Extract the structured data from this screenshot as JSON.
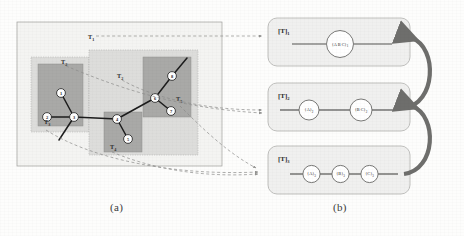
{
  "figure": {
    "captions": {
      "left": "(a)",
      "right": "(b)"
    }
  },
  "panel_a": {
    "name": "graph-partition-diagram",
    "region_labels": [
      {
        "id": "t1",
        "text": "T",
        "sub": "1",
        "x": 88,
        "y": 36
      },
      {
        "id": "t2-left",
        "text": "T",
        "sub": "2",
        "x": 64,
        "y": 62
      },
      {
        "id": "t2-right",
        "text": "T",
        "sub": "2",
        "x": 120,
        "y": 76
      },
      {
        "id": "t3",
        "text": "T",
        "sub": "3",
        "x": 42,
        "y": 128
      },
      {
        "id": "t4",
        "text": "T",
        "sub": "4",
        "x": 113,
        "y": 147
      },
      {
        "id": "t5",
        "text": "T",
        "sub": "5",
        "x": 180,
        "y": 102
      }
    ],
    "nodes": [
      {
        "id": "n1",
        "label": "1",
        "cx": 61,
        "cy": 93
      },
      {
        "id": "n2",
        "label": "2",
        "cx": 47,
        "cy": 117
      },
      {
        "id": "n3",
        "label": "3",
        "cx": 74,
        "cy": 117
      },
      {
        "id": "n4",
        "label": "4",
        "cx": 117,
        "cy": 119
      },
      {
        "id": "n5",
        "label": "5",
        "cx": 128,
        "cy": 139
      },
      {
        "id": "n6",
        "label": "6",
        "cx": 155,
        "cy": 98
      },
      {
        "id": "n7",
        "label": "7",
        "cx": 171,
        "cy": 111
      },
      {
        "id": "n8",
        "label": "8",
        "cx": 172,
        "cy": 76
      }
    ],
    "edges": [
      {
        "from": "n1",
        "to": "n3"
      },
      {
        "from": "n2",
        "to": "n3"
      },
      {
        "from": "n3",
        "to": "n4"
      },
      {
        "from": "n3",
        "to": "stub-a"
      },
      {
        "from": "n4",
        "to": "n5"
      },
      {
        "from": "n4",
        "to": "n6"
      },
      {
        "from": "n6",
        "to": "n7"
      },
      {
        "from": "n6",
        "to": "n8"
      },
      {
        "from": "n8",
        "to": "stub-b"
      }
    ]
  },
  "panel_b": {
    "name": "hierarchy-levels",
    "levels": [
      {
        "id": "level-1",
        "label": "[T]",
        "sub": "1",
        "nodes": [
          {
            "text": "{A B C}",
            "sub": "1"
          }
        ]
      },
      {
        "id": "level-2",
        "label": "[T]",
        "sub": "2",
        "nodes": [
          {
            "text": "{A}",
            "sub": "2"
          },
          {
            "text": "{B C}",
            "sub": "2"
          }
        ]
      },
      {
        "id": "level-3",
        "label": "[T]",
        "sub": "3",
        "nodes": [
          {
            "text": "{A}",
            "sub": "3"
          },
          {
            "text": "{B}",
            "sub": "3"
          },
          {
            "text": "{C}",
            "sub": "3"
          }
        ]
      }
    ],
    "merge_arrows": [
      {
        "id": "arrow-level3-to-level2"
      },
      {
        "id": "arrow-level2-to-level1"
      }
    ]
  },
  "colors": {
    "outer_region": "#ececea",
    "mid_region": "#d6d6d4",
    "inner_region": "#a9a9a7",
    "box_fill": "#f0f0ef",
    "box_stroke": "#b9b9b7",
    "edge": "#1c1c1c",
    "dashed": "#8d8d8b",
    "arrow": "#6e6e6c",
    "node_fill": "#ffffff"
  }
}
